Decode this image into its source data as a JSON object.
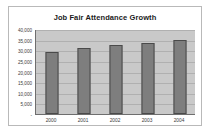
{
  "chart_data": {
    "type": "bar",
    "title": "Job Fair Attendance Growth",
    "xlabel": "",
    "ylabel": "",
    "categories": [
      "2000",
      "2001",
      "2002",
      "2003",
      "2004"
    ],
    "values": [
      29000,
      31000,
      32500,
      33500,
      35000
    ],
    "series": [
      {
        "name": "Attendance",
        "values": [
          29000,
          31000,
          32500,
          33500,
          35000
        ]
      }
    ],
    "ylim": [
      0,
      40000
    ],
    "ytick_values": [
      40000,
      35000,
      30000,
      25000,
      20000,
      15000,
      10000,
      5000,
      0
    ],
    "ytick_labels": [
      "40,000",
      "35,000",
      "30,000",
      "25,000",
      "20,000",
      "15,000",
      "10,000",
      "5,000",
      "-"
    ],
    "grid": true,
    "legend": false,
    "legend_position": "none",
    "colors": {
      "bar_fill": "#7e7e7e",
      "bar_border": "#4a4a4a",
      "plot_background": "#c9c9c9",
      "gridline": "#b0b0b0",
      "axis_line": "#6e6e6e",
      "card_background": "#ffffff",
      "card_border": "#b9b9b9",
      "title_text": "#1a1a1a",
      "tick_text": "#3c3c3c"
    }
  }
}
